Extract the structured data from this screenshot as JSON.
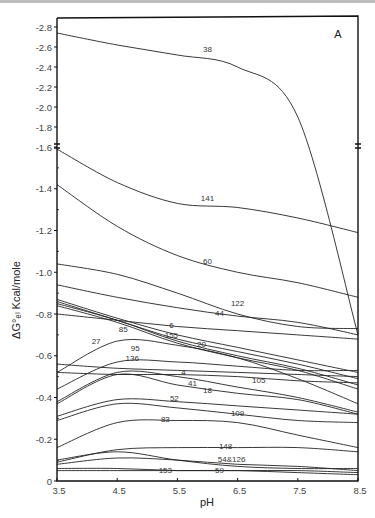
{
  "chart_data": {
    "type": "line",
    "title": "",
    "panel_label": "A",
    "xlabel": "pH",
    "ylabel": "ΔG°ₑₗ Kcal/mole",
    "xlim": [
      3.5,
      8.5
    ],
    "ylim": [
      0,
      2.8
    ],
    "y_axis_break": 1.6,
    "y_axis_sign_note": "tick labels shown negative (e.g. -2.8 ... -0.2, 0)",
    "x_ticks": [
      "3.5",
      "4.5",
      "5.5",
      "6.5",
      "7.5",
      "8.5"
    ],
    "y_ticks": [
      "-2.8",
      "-2.6",
      "-2.4",
      "-2.2",
      "-2.0",
      "-1.8",
      "-1.6",
      "-1.4",
      "-1.2",
      "-1.0",
      "-0.8",
      "-0.6",
      "-0.4",
      "-0.2",
      "0"
    ],
    "grid": false,
    "legend": "none (inline curve labels)",
    "x": [
      3.5,
      4.5,
      5.5,
      6.5,
      7.5,
      8.5
    ],
    "series": [
      {
        "name": "38",
        "values": [
          2.74,
          2.62,
          2.52,
          2.4,
          1.9,
          0.7
        ]
      },
      {
        "name": "141",
        "values": [
          1.59,
          1.43,
          1.33,
          1.31,
          1.26,
          1.19
        ]
      },
      {
        "name": "60",
        "values": [
          1.42,
          1.22,
          1.08,
          1.0,
          0.95,
          0.88
        ]
      },
      {
        "name": "122",
        "values": [
          1.04,
          0.99,
          0.9,
          0.8,
          0.74,
          0.73
        ]
      },
      {
        "name": "44",
        "values": [
          0.94,
          0.88,
          0.83,
          0.79,
          0.76,
          0.7
        ]
      },
      {
        "name": "6",
        "values": [
          0.8,
          0.77,
          0.74,
          0.72,
          0.7,
          0.68
        ]
      },
      {
        "name": "155",
        "values": [
          0.87,
          0.78,
          0.7,
          0.64,
          0.58,
          0.52
        ]
      },
      {
        "name": "20",
        "values": [
          0.86,
          0.77,
          0.68,
          0.62,
          0.56,
          0.49
        ]
      },
      {
        "name": "85",
        "values": [
          0.85,
          0.77,
          0.67,
          0.6,
          0.54,
          0.46
        ]
      },
      {
        "name": "95",
        "values": [
          0.84,
          0.76,
          0.66,
          0.59,
          0.53,
          0.44
        ]
      },
      {
        "name": "27",
        "values": [
          0.52,
          0.67,
          0.65,
          0.59,
          0.49,
          0.37
        ]
      },
      {
        "name": "136",
        "values": [
          0.44,
          0.57,
          0.57,
          0.55,
          0.53,
          0.53
        ]
      },
      {
        "name": "4",
        "values": [
          0.56,
          0.54,
          0.53,
          0.52,
          0.51,
          0.5
        ]
      },
      {
        "name": "105",
        "values": [
          0.52,
          0.51,
          0.51,
          0.5,
          0.48,
          0.47
        ]
      },
      {
        "name": "41",
        "values": [
          0.38,
          0.52,
          0.5,
          0.45,
          0.4,
          0.33
        ]
      },
      {
        "name": "18",
        "values": [
          0.37,
          0.51,
          0.46,
          0.42,
          0.39,
          0.32
        ]
      },
      {
        "name": "52",
        "values": [
          0.31,
          0.39,
          0.38,
          0.36,
          0.34,
          0.32
        ]
      },
      {
        "name": "109",
        "values": [
          0.29,
          0.37,
          0.35,
          0.32,
          0.29,
          0.28
        ]
      },
      {
        "name": "83",
        "values": [
          0.16,
          0.28,
          0.29,
          0.28,
          0.22,
          0.16
        ]
      },
      {
        "name": "148",
        "values": [
          0.09,
          0.15,
          0.16,
          0.16,
          0.16,
          0.14
        ]
      },
      {
        "name": "54&126",
        "values": [
          0.1,
          0.14,
          0.1,
          0.07,
          0.06,
          0.06
        ]
      },
      {
        "name": "54&126b",
        "values": [
          0.08,
          0.11,
          0.1,
          0.08,
          0.07,
          0.05
        ]
      },
      {
        "name": "59",
        "values": [
          0.06,
          0.06,
          0.05,
          0.05,
          0.05,
          0.04
        ]
      },
      {
        "name": "153",
        "values": [
          0.05,
          0.05,
          0.05,
          0.05,
          0.04,
          0.03
        ]
      }
    ],
    "curve_labels": [
      {
        "text": "38",
        "x": 6.0,
        "y": 2.55
      },
      {
        "text": "141",
        "x": 6.0,
        "y": 1.34
      },
      {
        "text": "60",
        "x": 6.0,
        "y": 1.04
      },
      {
        "text": "122",
        "x": 6.5,
        "y": 0.84
      },
      {
        "text": "44",
        "x": 6.2,
        "y": 0.79
      },
      {
        "text": "6",
        "x": 5.4,
        "y": 0.735
      },
      {
        "text": "155",
        "x": 5.4,
        "y": 0.685
      },
      {
        "text": "20",
        "x": 5.9,
        "y": 0.64
      },
      {
        "text": "85",
        "x": 4.6,
        "y": 0.715
      },
      {
        "text": "95",
        "x": 4.8,
        "y": 0.625
      },
      {
        "text": "27",
        "x": 4.15,
        "y": 0.655
      },
      {
        "text": "136",
        "x": 4.75,
        "y": 0.575
      },
      {
        "text": "4",
        "x": 5.6,
        "y": 0.51
      },
      {
        "text": "41",
        "x": 5.75,
        "y": 0.455
      },
      {
        "text": "105",
        "x": 6.85,
        "y": 0.47
      },
      {
        "text": "18",
        "x": 6.0,
        "y": 0.42
      },
      {
        "text": "52",
        "x": 5.45,
        "y": 0.385
      },
      {
        "text": "109",
        "x": 6.5,
        "y": 0.31
      },
      {
        "text": "83",
        "x": 5.3,
        "y": 0.285
      },
      {
        "text": "148",
        "x": 6.3,
        "y": 0.155
      },
      {
        "text": "54&126",
        "x": 6.4,
        "y": 0.09
      },
      {
        "text": "153",
        "x": 5.3,
        "y": 0.04
      },
      {
        "text": "59",
        "x": 6.2,
        "y": 0.04
      }
    ]
  }
}
